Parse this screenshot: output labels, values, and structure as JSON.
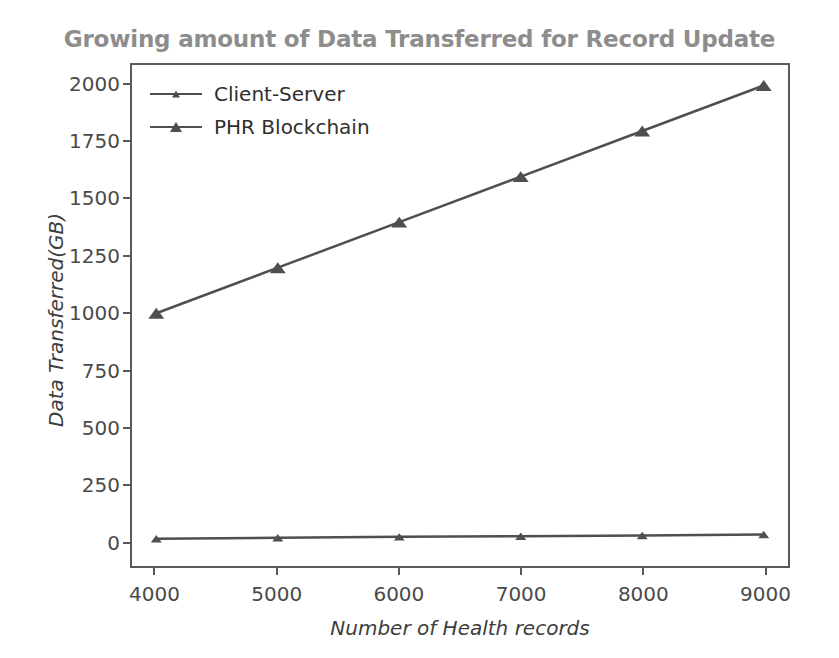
{
  "chart_data": {
    "type": "line",
    "title": "Growing amount of Data Transferred for Record Update",
    "xlabel": "Number of Health records",
    "ylabel": "Data Transferred(GB)",
    "x": [
      4000,
      5000,
      6000,
      7000,
      8000,
      9000
    ],
    "xticklabels": [
      "4000",
      "5000",
      "6000",
      "7000",
      "8000",
      "9000"
    ],
    "yticks": [
      0,
      250,
      500,
      750,
      1000,
      1250,
      1500,
      1750,
      2000
    ],
    "yticklabels": [
      "0",
      "250",
      "500",
      "750",
      "1000",
      "1250",
      "1500",
      "1750",
      "2000"
    ],
    "xlim": [
      3800,
      9200
    ],
    "ylim": [
      -110,
      2090
    ],
    "grid": false,
    "legend_position": "upper left",
    "series": [
      {
        "name": "Client-Server",
        "values": [
          10,
          14,
          18,
          21,
          24,
          28
        ],
        "color": "#4f4f4f",
        "marker": "triangle-small",
        "linewidth": 2.5
      },
      {
        "name": "PHR Blockchain",
        "values": [
          1000,
          1200,
          1400,
          1600,
          1800,
          2000
        ],
        "color": "#4f4f4f",
        "marker": "triangle",
        "linewidth": 2.5
      }
    ]
  },
  "style": {
    "title_color": "#8d8d8d",
    "axis_color": "#5a5a5a",
    "tick_label_color": "#4a4a4a",
    "axis_label_color": "#3d3d3d",
    "background": "#ffffff"
  }
}
